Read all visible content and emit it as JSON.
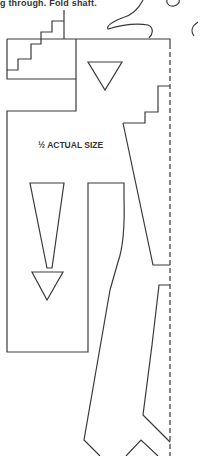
{
  "caption": "g through. Fold shaft.",
  "scale_label": "½ ACTUAL SIZE",
  "colors": {
    "line": "#3a3a3a",
    "background": "#ffffff"
  },
  "elements": {
    "fold_line": "dashed vertical fold line",
    "shapes": [
      "stair-step cutout top-left",
      "small downward triangle",
      "long arrow shape",
      "outer figure outline",
      "bird head silhouette"
    ]
  }
}
